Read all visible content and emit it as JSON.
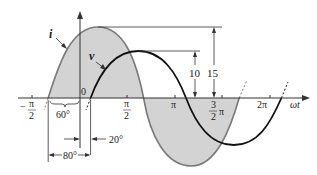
{
  "diagram": {
    "colors": {
      "current_curve": "#7a7a7a",
      "voltage_curve": "#111111",
      "fill": "#d3d3d3",
      "axis": "#333333"
    },
    "curves": {
      "current_label": "i",
      "voltage_label": "v"
    },
    "axis": {
      "x_label": "ωt",
      "origin_label": "0",
      "ticks": {
        "neg_half_pi_sign": "−",
        "neg_half_pi_num": "π",
        "neg_half_pi_den": "2",
        "half_pi_num": "π",
        "half_pi_den": "2",
        "pi": "π",
        "three_half_pi_num": "3",
        "three_half_pi_den": "2",
        "three_half_pi_pi": "π",
        "two_pi": "2π"
      }
    },
    "amplitudes": {
      "voltage_peak": "10",
      "current_peak": "15"
    },
    "angles": {
      "current_lead": "60°",
      "voltage_lag": "20°",
      "phase_difference": "80°"
    }
  }
}
